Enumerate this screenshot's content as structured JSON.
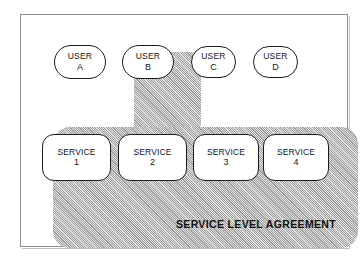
{
  "diagram": {
    "title": "Service Level Agreement",
    "frame": {
      "border_color": "#8e8e94",
      "background": "#ffffff"
    },
    "shaded_region": {
      "name": "service-level-agreement-region",
      "fill_color": "#b9b9b9",
      "pattern": "diagonal-hatch",
      "caption": "SERVICE LEVEL AGREEMENT"
    },
    "users": [
      {
        "id": "user-a",
        "line1": "USER",
        "line2": "A",
        "highlighted": false,
        "x": 53,
        "y": 44,
        "w": 52,
        "h": 34
      },
      {
        "id": "user-b",
        "line1": "USER",
        "line2": "B",
        "highlighted": true,
        "x": 121,
        "y": 44,
        "w": 52,
        "h": 34
      },
      {
        "id": "user-c",
        "line1": "USER",
        "line2": "C",
        "highlighted": false,
        "x": 190,
        "y": 45,
        "w": 45,
        "h": 32
      },
      {
        "id": "user-d",
        "line1": "USER",
        "line2": "D",
        "highlighted": false,
        "x": 252,
        "y": 45,
        "w": 45,
        "h": 32
      }
    ],
    "services": [
      {
        "id": "service-1",
        "line1": "SERVICE",
        "line2": "1",
        "x": 41,
        "y": 133,
        "w": 69,
        "h": 47
      },
      {
        "id": "service-2",
        "line1": "SERVICE",
        "line2": "2",
        "x": 117,
        "y": 133,
        "w": 69,
        "h": 47
      },
      {
        "id": "service-3",
        "line1": "SERVICE",
        "line2": "3",
        "x": 192,
        "y": 133,
        "w": 66,
        "h": 47
      },
      {
        "id": "service-4",
        "line1": "SERVICE",
        "line2": "4",
        "x": 262,
        "y": 133,
        "w": 66,
        "h": 47
      }
    ]
  }
}
